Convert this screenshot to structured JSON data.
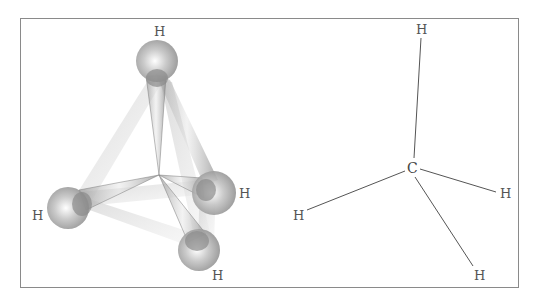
{
  "figure": {
    "left_panel": {
      "description": "3D ball-and-stick tetrahedral methane model",
      "atoms": [
        {
          "label": "H",
          "position": "top"
        },
        {
          "label": "H",
          "position": "left"
        },
        {
          "label": "H",
          "position": "right"
        },
        {
          "label": "H",
          "position": "bottom"
        }
      ]
    },
    "right_panel": {
      "description": "Line drawing of tetrahedral CH4",
      "center_label": "C",
      "atoms": [
        {
          "label": "H",
          "position": "top"
        },
        {
          "label": "H",
          "position": "left"
        },
        {
          "label": "H",
          "position": "right"
        },
        {
          "label": "H",
          "position": "bottom"
        }
      ]
    }
  }
}
